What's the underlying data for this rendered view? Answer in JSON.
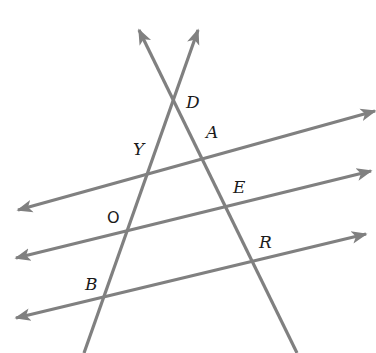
{
  "diagram": {
    "title": "",
    "colors": {
      "line": "#808080",
      "label": "#1a1a1a",
      "background": "#ffffff"
    },
    "transversals": [
      {
        "id": "t1",
        "name": "line through D, A, E, R",
        "from": [
          139,
          30
        ],
        "to": [
          297,
          353
        ],
        "arrow_start": true,
        "arrow_end": false
      },
      {
        "id": "t2",
        "name": "line through D, Y, O, B",
        "from": [
          198,
          30
        ],
        "to": [
          84,
          353
        ],
        "arrow_start": true,
        "arrow_end": false
      }
    ],
    "parallels": [
      {
        "id": "p1",
        "name": "line through Y and A",
        "from": [
          18,
          210
        ],
        "to": [
          375,
          111
        ],
        "arrow_start": true,
        "arrow_end": true
      },
      {
        "id": "p2",
        "name": "line through O and E",
        "from": [
          16,
          258
        ],
        "to": [
          371,
          171
        ],
        "arrow_start": true,
        "arrow_end": true
      },
      {
        "id": "p3",
        "name": "line through B and R",
        "from": [
          16,
          318
        ],
        "to": [
          366,
          234
        ],
        "arrow_start": true,
        "arrow_end": true
      }
    ],
    "points": [
      {
        "label": "D",
        "x": 173,
        "y": 102,
        "label_x": 186,
        "label_y": 108,
        "italic": true
      },
      {
        "label": "A",
        "x": 200,
        "y": 153,
        "label_x": 206,
        "label_y": 138,
        "italic": true
      },
      {
        "label": "Y",
        "x": 152,
        "y": 161,
        "label_x": 133,
        "label_y": 155,
        "italic": true
      },
      {
        "label": "E",
        "x": 225,
        "y": 207,
        "label_x": 233,
        "label_y": 193,
        "italic": true
      },
      {
        "label": "O",
        "x": 129,
        "y": 229,
        "label_x": 107,
        "label_y": 223,
        "italic": false
      },
      {
        "label": "R",
        "x": 252,
        "y": 262,
        "label_x": 259,
        "label_y": 248,
        "italic": true
      },
      {
        "label": "B",
        "x": 106,
        "y": 296,
        "label_x": 85,
        "label_y": 290,
        "italic": true
      }
    ]
  }
}
